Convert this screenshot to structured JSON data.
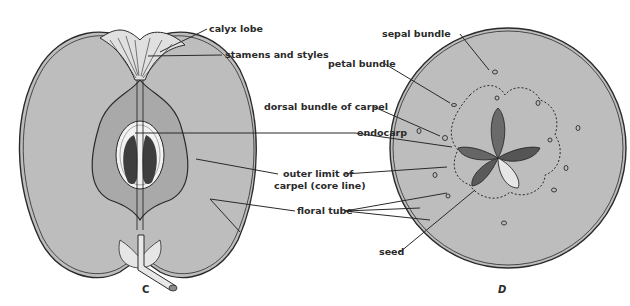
{
  "figure_c": {
    "letter": "C",
    "description": "Longitudinal section of apple fruit",
    "labels": {
      "calyx_lobe": "calyx lobe",
      "stamens_and_styles": "stamens and styles",
      "endocarp": "endocarp",
      "outer_limit_line1": "outer limit of",
      "outer_limit_line2": "carpel (core line)",
      "floral_tube": "floral tube"
    }
  },
  "figure_d": {
    "letter": "D",
    "description": "Cross section of apple fruit",
    "labels": {
      "sepal_bundle": "sepal bundle",
      "petal_bundle": "petal bundle",
      "dorsal_bundle": "dorsal bundle of carpel",
      "seed": "seed"
    }
  },
  "colors": {
    "flesh": "#bdbdbd",
    "core": "#a9a9a9",
    "line": "#2a2a2a",
    "seed_dark": "#555555",
    "background": "#ffffff"
  }
}
